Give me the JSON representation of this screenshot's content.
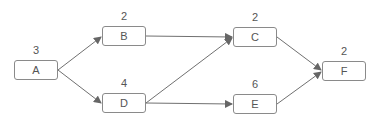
{
  "diagram": {
    "type": "activity-network",
    "nodes": [
      {
        "id": "A",
        "label": "A",
        "duration": "3",
        "x": 14,
        "y": 60
      },
      {
        "id": "B",
        "label": "B",
        "duration": "2",
        "x": 102,
        "y": 26
      },
      {
        "id": "C",
        "label": "C",
        "duration": "2",
        "x": 233,
        "y": 27
      },
      {
        "id": "D",
        "label": "D",
        "duration": "4",
        "x": 102,
        "y": 93
      },
      {
        "id": "E",
        "label": "E",
        "duration": "6",
        "x": 233,
        "y": 94
      },
      {
        "id": "F",
        "label": "F",
        "duration": "2",
        "x": 322,
        "y": 61
      }
    ],
    "edges": [
      {
        "from": "A",
        "to": "B"
      },
      {
        "from": "A",
        "to": "D"
      },
      {
        "from": "B",
        "to": "C"
      },
      {
        "from": "D",
        "to": "C"
      },
      {
        "from": "D",
        "to": "E"
      },
      {
        "from": "C",
        "to": "F"
      },
      {
        "from": "E",
        "to": "F"
      }
    ],
    "colors": {
      "line": "#707070",
      "border": "#8a8a8a",
      "text": "#555555"
    }
  }
}
